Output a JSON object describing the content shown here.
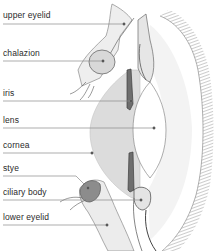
{
  "diagram": {
    "labels": [
      {
        "id": "upper-eyelid",
        "text": "upper eyelid",
        "y": 10,
        "line_y": 24,
        "end_x": 124
      },
      {
        "id": "chalazion",
        "text": "chalazion",
        "y": 42,
        "line_y": 61,
        "end_x": 103
      },
      {
        "id": "iris",
        "text": "iris",
        "y": 86,
        "line_y": 101,
        "end_x": 131
      },
      {
        "id": "lens",
        "text": "lens",
        "y": 110,
        "line_y": 128,
        "end_x": 154
      },
      {
        "id": "cornea",
        "text": "cornea",
        "y": 139,
        "line_y": 153,
        "end_x": 92
      },
      {
        "id": "stye",
        "text": "stye",
        "y": 163,
        "line_y": 176,
        "end_x": 88
      },
      {
        "id": "ciliary-body",
        "text": "ciliary body",
        "y": 186,
        "line_y": 200,
        "end_x": 141
      },
      {
        "id": "lower-eyelid",
        "text": "lower eyelid",
        "y": 211,
        "line_y": 225,
        "end_x": 107
      }
    ]
  },
  "colors": {
    "background": "#ffffff",
    "text": "#2a2a2a",
    "leader_line": "#8a8a8a",
    "cornea_fill": "#dcdcdc",
    "tissue": "#bdbdbd",
    "dark_tissue": "#555555"
  }
}
